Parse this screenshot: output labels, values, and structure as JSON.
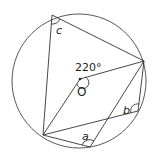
{
  "diagram": {
    "labels": {
      "center": "O",
      "angle_center": "220°",
      "angle_a": "a",
      "angle_b": "b",
      "angle_c": "c"
    },
    "colors": {
      "stroke": "#333333",
      "background": "#ffffff"
    }
  }
}
